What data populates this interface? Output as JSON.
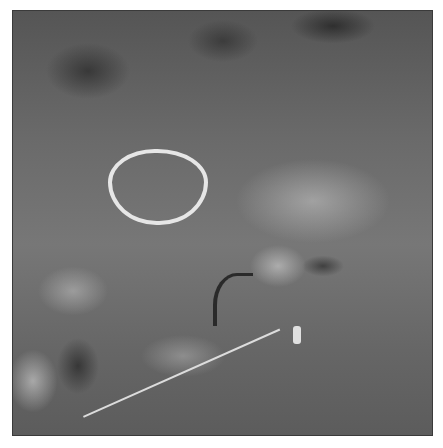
{
  "image": {
    "description": "Grayscale photograph of a weathered rock surface with a white chalk-outlined oval (cup mark) and a faint white diagonal line, framed by a thin dark border",
    "frame_color": "#3a3a3a",
    "background_color": "#ffffff"
  }
}
